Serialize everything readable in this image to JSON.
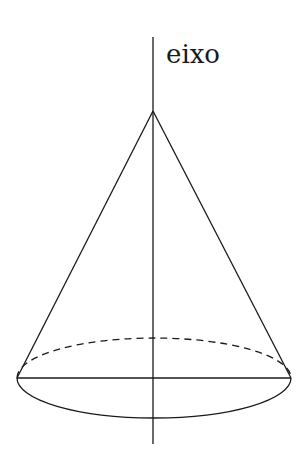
{
  "diagram": {
    "type": "cone",
    "axis_label": "eixo",
    "stroke_color": "#1a1a1a",
    "background": "#ffffff",
    "apex": [
      153,
      111
    ],
    "axis": {
      "x": 153,
      "y_top": 37,
      "y_bottom": 444
    },
    "base": {
      "cx": 154,
      "cy": 378,
      "rx": 137,
      "ry": 40,
      "back_half_style": "dashed",
      "front_half_style": "solid"
    }
  }
}
